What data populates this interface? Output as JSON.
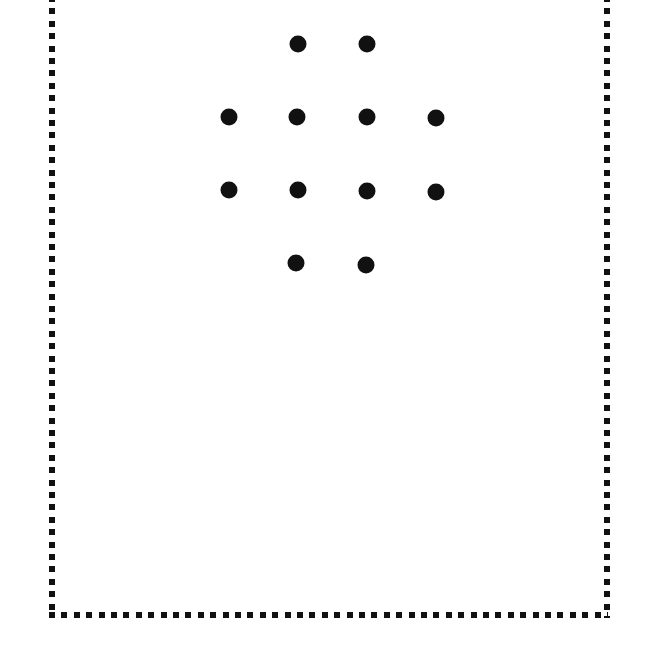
{
  "caption": {
    "text_visible": "",
    "note_clipped": true
  },
  "frame": {
    "style": "dotted-square-border",
    "color": "#111111"
  },
  "dots": {
    "color": "#111111",
    "items": [
      {
        "row": 1,
        "x": 298,
        "y": 44
      },
      {
        "row": 1,
        "x": 367,
        "y": 44
      },
      {
        "row": 2,
        "x": 229,
        "y": 117
      },
      {
        "row": 2,
        "x": 297,
        "y": 117
      },
      {
        "row": 2,
        "x": 367,
        "y": 117
      },
      {
        "row": 2,
        "x": 436,
        "y": 118
      },
      {
        "row": 3,
        "x": 229,
        "y": 190
      },
      {
        "row": 3,
        "x": 298,
        "y": 190
      },
      {
        "row": 3,
        "x": 367,
        "y": 191
      },
      {
        "row": 3,
        "x": 436,
        "y": 192
      },
      {
        "row": 4,
        "x": 296,
        "y": 263
      },
      {
        "row": 4,
        "x": 366,
        "y": 265
      }
    ]
  }
}
